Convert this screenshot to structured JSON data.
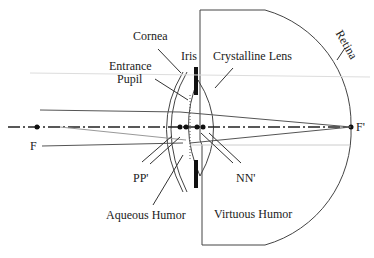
{
  "labels": {
    "cornea": "Cornea",
    "iris": "Iris",
    "entrance_pupil_1": "Entrance",
    "entrance_pupil_2": "Pupil",
    "crystalline_lens": "Crystalline Lens",
    "retina": "Retina",
    "f": "F",
    "f_prime": "F'",
    "pp": "PP'",
    "nn": "NN'",
    "aqueous_humor": "Aqueous Humor",
    "vitreous_humor": "Virtuous Humor"
  },
  "colors": {
    "line": "#333333",
    "light_line": "#bbbbbb",
    "iris": "#111111"
  }
}
